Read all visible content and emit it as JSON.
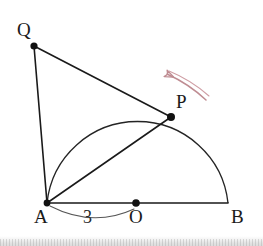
{
  "figure": {
    "canvas": {
      "width": 263,
      "height": 246
    },
    "background_color": "#ffffff",
    "stroke_color": "#1a1a1a",
    "arrow_color": "#bf8c92"
  },
  "points": [
    {
      "id": "Q",
      "label": "Q",
      "x": 34,
      "y": 46,
      "dot": true
    },
    {
      "id": "P",
      "label": "P",
      "x": 171,
      "y": 117,
      "dot": true
    },
    {
      "id": "A",
      "label": "A",
      "x": 47,
      "y": 203,
      "dot": true
    },
    {
      "id": "O",
      "label": "O",
      "x": 136,
      "y": 203,
      "dot": true
    },
    {
      "id": "B",
      "label": "B",
      "x": 228,
      "y": 203,
      "dot": false
    }
  ],
  "segments": [
    {
      "id": "QA",
      "from": "Q",
      "to": "A"
    },
    {
      "id": "QP",
      "from": "Q",
      "to": "P"
    },
    {
      "id": "AP",
      "from": "A",
      "to": "P"
    },
    {
      "id": "AB",
      "from": "A",
      "to": "B"
    }
  ],
  "arc": {
    "id": "semicircle-AB",
    "center_x": 136,
    "center_y": 203,
    "radius": 91,
    "description": "upper semicircle on diameter AB centered at O"
  },
  "measurement": {
    "id": "AO-length",
    "value": "3",
    "from": "A",
    "to": "O",
    "description": "brace arc under segment AO labeled 3"
  },
  "annotation": {
    "id": "rotation-arrow",
    "color": "#bf8c92",
    "direction": "counterclockwise",
    "description": "curved arrow above P indicating direction of motion"
  }
}
